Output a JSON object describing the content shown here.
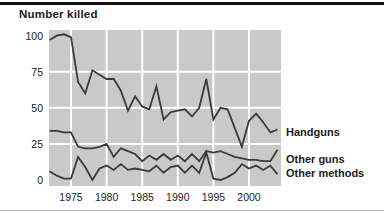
{
  "page": {
    "title": "Number killed"
  },
  "colors": {
    "plot_background": "#c9c9c9",
    "gridline": "#ffffff",
    "line": "#3a3a3a",
    "text": "#1a1a1a",
    "top_rule": "#111111",
    "bottom_rule": "#b9b9b9"
  },
  "chart_data": {
    "type": "line",
    "title": "Number killed",
    "xlabel": "",
    "ylabel": "Number killed",
    "ylim": [
      0,
      100
    ],
    "yticks": [
      100,
      75,
      50,
      25,
      0
    ],
    "xticks": [
      1975,
      1980,
      1985,
      1990,
      1995,
      2000
    ],
    "grid": true,
    "legend_position": "right-of-line-ends",
    "x": [
      1972,
      1973,
      1974,
      1975,
      1976,
      1977,
      1978,
      1979,
      1980,
      1981,
      1982,
      1983,
      1984,
      1985,
      1986,
      1987,
      1988,
      1989,
      1990,
      1991,
      1992,
      1993,
      1994,
      1995,
      1996,
      1997,
      1998,
      1999,
      2000,
      2001,
      2002,
      2003,
      2004
    ],
    "series": [
      {
        "name": "Handguns",
        "values": [
          97,
          100,
          101,
          99,
          68,
          60,
          76,
          73,
          70,
          70,
          62,
          48,
          58,
          51,
          49,
          65,
          42,
          47,
          48,
          49,
          44,
          50,
          70,
          42,
          50,
          49,
          36,
          23,
          41,
          46,
          40,
          33,
          35
        ]
      },
      {
        "name": "Other guns",
        "values": [
          34,
          34,
          33,
          33,
          23,
          22,
          22,
          23,
          25,
          16,
          22,
          20,
          18,
          13,
          17,
          14,
          18,
          14,
          17,
          13,
          18,
          13,
          20,
          19,
          20,
          18,
          16,
          15,
          14,
          14,
          13,
          13,
          21
        ]
      },
      {
        "name": "Other methods",
        "values": [
          6,
          3,
          1,
          1,
          16,
          9,
          0,
          8,
          10,
          7,
          11,
          7,
          8,
          7,
          6,
          10,
          5,
          9,
          10,
          5,
          10,
          5,
          19,
          1,
          0,
          2,
          5,
          11,
          8,
          10,
          7,
          10,
          4
        ]
      }
    ]
  }
}
